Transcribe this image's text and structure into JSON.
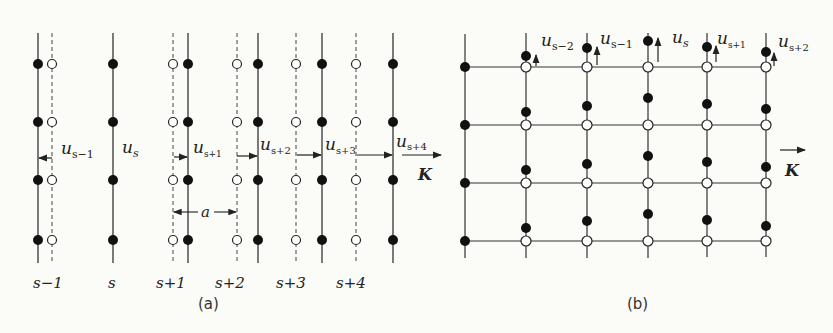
{
  "panel_a": {
    "caption": "(a)",
    "plane_labels": [
      "s−1",
      "s",
      "s+1",
      "s+2",
      "s+3",
      "s+4"
    ],
    "displacement_labels": [
      {
        "base": "u",
        "sub": "s−1"
      },
      {
        "base": "u",
        "sub": "s"
      },
      {
        "base": "u",
        "sub": "s+1"
      },
      {
        "base": "u",
        "sub": "s+2"
      },
      {
        "base": "u",
        "sub": "s+3"
      },
      {
        "base": "u",
        "sub": "s+4"
      }
    ],
    "spacing_label": "a",
    "wavevector_label": "K"
  },
  "panel_b": {
    "caption": "(b)",
    "displacement_labels": [
      {
        "base": "u",
        "sub": "s−2"
      },
      {
        "base": "u",
        "sub": "s−1"
      },
      {
        "base": "u",
        "sub": "s"
      },
      {
        "base": "u",
        "sub": "s+1"
      },
      {
        "base": "u",
        "sub": "s+2"
      }
    ],
    "wavevector_label": "K"
  },
  "colors": {
    "line": "#333333",
    "filled_atom": "#111111",
    "open_atom_fill": "#ffffff",
    "background": "#fbfbf7"
  }
}
